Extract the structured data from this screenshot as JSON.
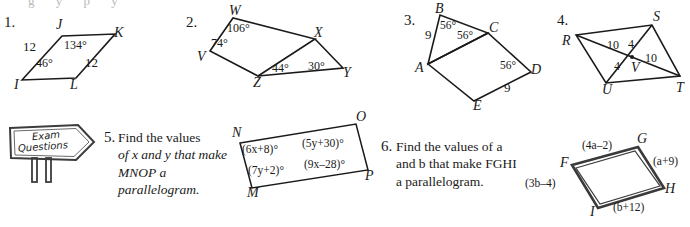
{
  "page": {
    "clipped_top_line": "g y p y",
    "background": "#ffffff",
    "ink": "#1a1a1a"
  },
  "problems": [
    {
      "number": "1.",
      "figure": {
        "name": "parallelogram-ijkl",
        "vertices": [
          "I",
          "J",
          "K",
          "L"
        ],
        "labels": [
          "12",
          "134°",
          "46°",
          "12"
        ],
        "side_lengths": [
          "12",
          "12"
        ],
        "angles": [
          "134°",
          "46°"
        ]
      }
    },
    {
      "number": "2.",
      "figure": {
        "name": "parallelogram-vwxz-with-triangle-xzy",
        "vertices": [
          "W",
          "X",
          "V",
          "Z",
          "Y"
        ],
        "angles": [
          "106°",
          "74°",
          "44°",
          "30°"
        ]
      }
    },
    {
      "number": "3.",
      "figure": {
        "name": "triangle-abc-with-parallelogram-acde",
        "vertices": [
          "B",
          "C",
          "A",
          "D",
          "E"
        ],
        "labels": [
          "9",
          "56°",
          "56°",
          "56°",
          "9"
        ],
        "side_lengths": [
          "9",
          "9"
        ],
        "angles": [
          "56°",
          "56°",
          "56°"
        ]
      }
    },
    {
      "number": "4.",
      "figure": {
        "name": "parallelogram-rstu-with-diagonals",
        "vertices": [
          "R",
          "S",
          "V",
          "U",
          "T"
        ],
        "labels": [
          "10",
          "4",
          "4",
          "10"
        ],
        "segment_lengths": [
          "10",
          "4",
          "4",
          "10"
        ]
      }
    },
    {
      "number": "5.",
      "prompt_lines": [
        "Find the values",
        "of x and y that make",
        "MNOP a parallelogram."
      ],
      "prompt_plain": "Find the values of x and y that make MNOP a parallelogram.",
      "figure": {
        "name": "parallelogram-mnop",
        "vertices": [
          "N",
          "O",
          "M",
          "P"
        ],
        "expressions": [
          "(6x+8)°",
          "(5y+30)°",
          "(7y+2)°",
          "(9x–28)°"
        ]
      },
      "decoration": {
        "name": "exam-questions-signpost",
        "line1": "Exam",
        "line2": "Questions"
      }
    },
    {
      "number": "6.",
      "prompt_lines": [
        "Find the values of a",
        "and b that make FGHI",
        "a parallelogram."
      ],
      "prompt_plain": "Find the values of a and b that make FGHI a parallelogram.",
      "figure": {
        "name": "parallelogram-fghi",
        "vertices": [
          "F",
          "G",
          "H",
          "I"
        ],
        "expressions": [
          "(4a–2)",
          "(a+9)",
          "(3b–4)",
          "(b+12)"
        ]
      }
    }
  ]
}
